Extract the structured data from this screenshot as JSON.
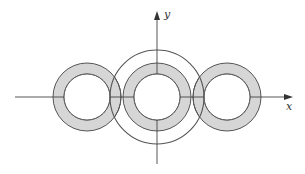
{
  "diagram": {
    "axes": {
      "x_label": "x",
      "y_label": "y"
    },
    "rings": [
      {
        "name": "left-ring",
        "cx": 87,
        "cy": 97,
        "r_outer": 34,
        "r_inner": 23
      },
      {
        "name": "center-ring",
        "cx": 157,
        "cy": 97,
        "r_outer": 34,
        "r_inner": 23
      },
      {
        "name": "right-ring",
        "cx": 227,
        "cy": 97,
        "r_outer": 34,
        "r_inner": 23
      }
    ],
    "big_circle": {
      "cx": 157,
      "cy": 97,
      "r": 47
    },
    "colors": {
      "ring_fill": "#d6d6d6",
      "stroke": "#555555",
      "background": "#ffffff"
    }
  }
}
